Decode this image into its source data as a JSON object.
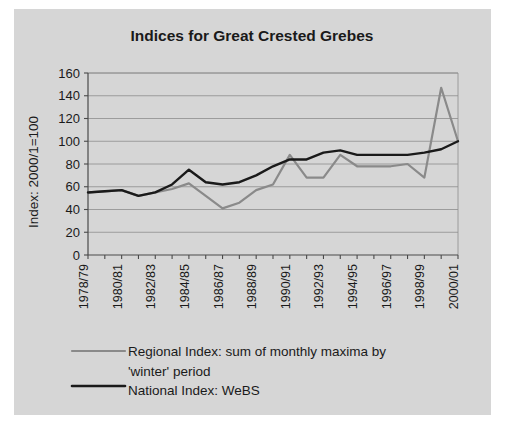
{
  "figure": {
    "background_color": "#d6d6d6",
    "title": "Indices for Great Crested Grebes"
  },
  "legend": {
    "regional_label": "Regional Index: sum of monthly maxima by",
    "regional_label_line2": "'winter' period",
    "national_label": "National Index: WeBS"
  },
  "chart_data": {
    "type": "line",
    "title": "Indices for Great Crested Grebes",
    "xlabel": "",
    "ylabel": "Index: 2000/1=100",
    "ylim": [
      0,
      160
    ],
    "yticks": [
      0,
      20,
      40,
      60,
      80,
      100,
      120,
      140,
      160
    ],
    "ytick_labels": [
      "0",
      "20",
      "40",
      "60",
      "80",
      "100",
      "120",
      "140",
      "160"
    ],
    "grid": true,
    "legend_position": "below",
    "categories": [
      "1978/79",
      "1979/80",
      "1980/81",
      "1981/82",
      "1982/83",
      "1983/84",
      "1984/85",
      "1985/86",
      "1986/87",
      "1987/88",
      "1988/89",
      "1989/90",
      "1990/91",
      "1991/92",
      "1992/93",
      "1993/94",
      "1994/95",
      "1995/96",
      "1996/97",
      "1997/98",
      "1998/99",
      "1999/00",
      "2000/01"
    ],
    "xtick_labels_shown": [
      "1978/79",
      "1980/81",
      "1982/83",
      "1984/85",
      "1986/87",
      "1988/89",
      "1990/91",
      "1992/93",
      "1994/95",
      "1996/97",
      "1998/99",
      "2000/01"
    ],
    "xtick_label_interval": 2,
    "series": [
      {
        "name": "Regional Index: sum of monthly maxima by 'winter' period",
        "color": "#8a8a8a",
        "width": 2.2,
        "values": [
          55,
          56,
          57,
          52,
          55,
          58,
          63,
          52,
          41,
          46,
          57,
          62,
          88,
          68,
          68,
          88,
          78,
          78,
          78,
          80,
          68,
          147,
          100
        ]
      },
      {
        "name": "National Index: WeBS",
        "color": "#1a1a1a",
        "width": 2.4,
        "values": [
          55,
          56,
          57,
          52,
          55,
          62,
          75,
          64,
          62,
          64,
          70,
          78,
          84,
          84,
          90,
          92,
          88,
          88,
          88,
          88,
          90,
          93,
          100
        ]
      }
    ]
  }
}
